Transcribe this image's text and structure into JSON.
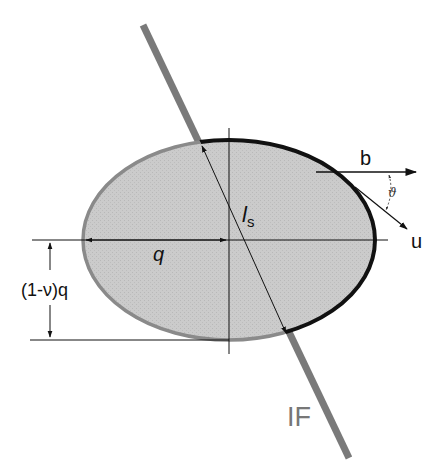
{
  "diagram": {
    "colors": {
      "ellipse_fill": "#c8c8c8",
      "ellipse_outline_left": "#8a8a8a",
      "ellipse_outline_right": "#111111",
      "interface_band": "#7a7a7a",
      "axes": "#111111",
      "label_if": "#777777"
    },
    "labels": {
      "b": "b",
      "u": "u",
      "theta": "ϑ",
      "ls_main": "l",
      "ls_sub": "s",
      "q": "q",
      "one_minus_nu_q": "(1-ν)q",
      "interface": "IF"
    }
  }
}
